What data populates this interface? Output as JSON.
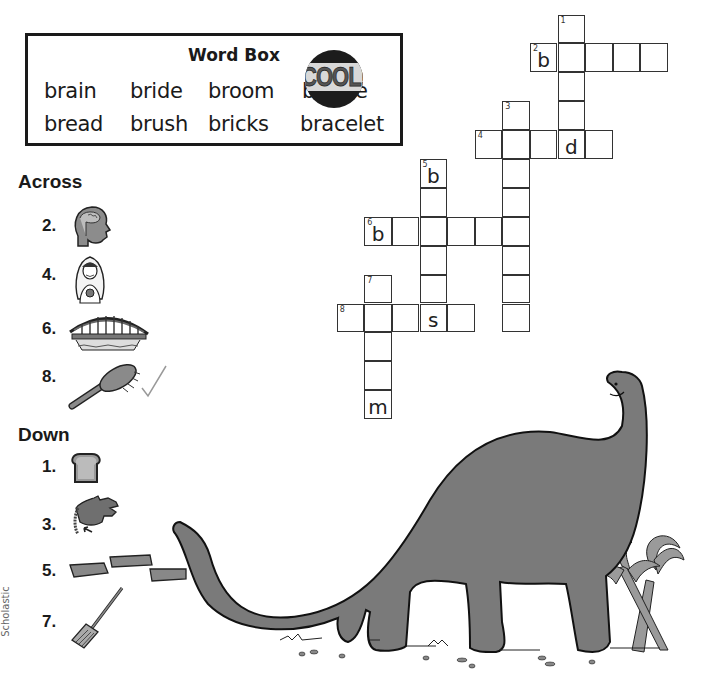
{
  "word_box": {
    "title": "Word Box",
    "words": [
      "brain",
      "bride",
      "broom",
      "bridge",
      "bread",
      "brush",
      "bricks",
      "bracelet"
    ],
    "sticker": "COOL!"
  },
  "across": {
    "title": "Across",
    "clues": [
      {
        "number": "2.",
        "picture": "head-with-brain-icon"
      },
      {
        "number": "4.",
        "picture": "bride-icon"
      },
      {
        "number": "6.",
        "picture": "bridge-icon"
      },
      {
        "number": "8.",
        "picture": "brush-icon",
        "mark": "checkmark"
      }
    ]
  },
  "down": {
    "title": "Down",
    "clues": [
      {
        "number": "1.",
        "picture": "bread-slice-icon"
      },
      {
        "number": "3.",
        "picture": "hand-with-bracelet-icon"
      },
      {
        "number": "5.",
        "picture": "bricks-icon"
      },
      {
        "number": "7.",
        "picture": "broom-icon"
      }
    ]
  },
  "crossword": {
    "cells": [
      {
        "c": 8,
        "r": 0,
        "n": "1",
        "l": ""
      },
      {
        "c": 7,
        "r": 1,
        "n": "2",
        "l": "b"
      },
      {
        "c": 8,
        "r": 1,
        "n": "",
        "l": ""
      },
      {
        "c": 9,
        "r": 1,
        "n": "",
        "l": ""
      },
      {
        "c": 10,
        "r": 1,
        "n": "",
        "l": ""
      },
      {
        "c": 11,
        "r": 1,
        "n": "",
        "l": ""
      },
      {
        "c": 8,
        "r": 2,
        "n": "",
        "l": ""
      },
      {
        "c": 6,
        "r": 3,
        "n": "3",
        "l": ""
      },
      {
        "c": 8,
        "r": 3,
        "n": "",
        "l": ""
      },
      {
        "c": 5,
        "r": 4,
        "n": "4",
        "l": ""
      },
      {
        "c": 6,
        "r": 4,
        "n": "",
        "l": ""
      },
      {
        "c": 7,
        "r": 4,
        "n": "",
        "l": ""
      },
      {
        "c": 8,
        "r": 4,
        "n": "",
        "l": "d"
      },
      {
        "c": 9,
        "r": 4,
        "n": "",
        "l": ""
      },
      {
        "c": 3,
        "r": 5,
        "n": "5",
        "l": "b"
      },
      {
        "c": 6,
        "r": 5,
        "n": "",
        "l": ""
      },
      {
        "c": 3,
        "r": 6,
        "n": "",
        "l": ""
      },
      {
        "c": 6,
        "r": 6,
        "n": "",
        "l": ""
      },
      {
        "c": 1,
        "r": 7,
        "n": "6",
        "l": "b"
      },
      {
        "c": 2,
        "r": 7,
        "n": "",
        "l": ""
      },
      {
        "c": 3,
        "r": 7,
        "n": "",
        "l": ""
      },
      {
        "c": 4,
        "r": 7,
        "n": "",
        "l": ""
      },
      {
        "c": 5,
        "r": 7,
        "n": "",
        "l": ""
      },
      {
        "c": 6,
        "r": 7,
        "n": "",
        "l": ""
      },
      {
        "c": 3,
        "r": 8,
        "n": "",
        "l": ""
      },
      {
        "c": 6,
        "r": 8,
        "n": "",
        "l": ""
      },
      {
        "c": 1,
        "r": 9,
        "n": "7",
        "l": ""
      },
      {
        "c": 3,
        "r": 9,
        "n": "",
        "l": ""
      },
      {
        "c": 6,
        "r": 9,
        "n": "",
        "l": ""
      },
      {
        "c": 0,
        "r": 10,
        "n": "8",
        "l": ""
      },
      {
        "c": 1,
        "r": 10,
        "n": "",
        "l": ""
      },
      {
        "c": 2,
        "r": 10,
        "n": "",
        "l": ""
      },
      {
        "c": 3,
        "r": 10,
        "n": "",
        "l": "s"
      },
      {
        "c": 4,
        "r": 10,
        "n": "",
        "l": ""
      },
      {
        "c": 6,
        "r": 10,
        "n": "",
        "l": ""
      },
      {
        "c": 1,
        "r": 11,
        "n": "",
        "l": ""
      },
      {
        "c": 1,
        "r": 12,
        "n": "",
        "l": ""
      },
      {
        "c": 1,
        "r": 13,
        "n": "",
        "l": "m"
      }
    ]
  },
  "illustration": "brontosaurus-with-palm-trees",
  "credit": "Scholastic",
  "colors": {
    "ink": "#1a1a1a",
    "dino": "#7a7a7a",
    "palm": "#9a9a9a",
    "grid": "#333333"
  }
}
